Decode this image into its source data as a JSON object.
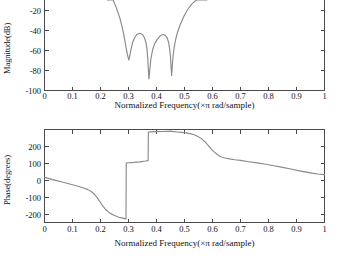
{
  "figure": {
    "background_color": "#ffffff",
    "line_color": "#8a8a8a",
    "axis_color": "#4a4a4a"
  },
  "panels": {
    "magnitude": {
      "ylabel": "Magnitude(dB)",
      "xlabel": "Normalized Frequency(×π rad/sample)",
      "ytick_labels": [
        "-20",
        "-40",
        "-60",
        "-80",
        "-100"
      ],
      "xtick_labels": [
        "0",
        "0.1",
        "0.2",
        "0.3",
        "0.4",
        "0.5",
        "0.6",
        "0.7",
        "0.8",
        "0.9",
        "1"
      ]
    },
    "phase": {
      "ylabel": "Phase(degrees)",
      "xlabel": "Normalized Frequency(×π rad/sample)",
      "ytick_labels": [
        "200",
        "100",
        "0",
        "-100",
        "-200"
      ],
      "xtick_labels": [
        "0",
        "0.1",
        "0.2",
        "0.3",
        "0.4",
        "0.5",
        "0.6",
        "0.7",
        "0.8",
        "0.9",
        "1"
      ]
    }
  },
  "chart_data": [
    {
      "type": "line",
      "title": "",
      "xlabel": "Normalized Frequency(×π rad/sample)",
      "ylabel": "Magnitude(dB)",
      "xlim": [
        0,
        1
      ],
      "ylim": [
        -100,
        -10
      ],
      "yticks": [
        -20,
        -40,
        -60,
        -80,
        -100
      ],
      "xticks": [
        0,
        0.1,
        0.2,
        0.3,
        0.4,
        0.5,
        0.6,
        0.7,
        0.8,
        0.9,
        1
      ],
      "grid": false,
      "legend": "none",
      "note": "Top panel is cropped at the top of the image; curve exits above the -10 dB visible edge for x<0.23 and x>0.58",
      "series": [
        {
          "name": "Magnitude response",
          "x": [
            0.225,
            0.235,
            0.245,
            0.255,
            0.262,
            0.27,
            0.277,
            0.283,
            0.288,
            0.292,
            0.296,
            0.299,
            0.301,
            0.303,
            0.306,
            0.31,
            0.315,
            0.322,
            0.33,
            0.34,
            0.35,
            0.357,
            0.362,
            0.366,
            0.369,
            0.371,
            0.373,
            0.376,
            0.38,
            0.386,
            0.394,
            0.404,
            0.414,
            0.424,
            0.432,
            0.438,
            0.443,
            0.447,
            0.45,
            0.452,
            0.454,
            0.456,
            0.459,
            0.463,
            0.468,
            0.475,
            0.485,
            0.497,
            0.51,
            0.525,
            0.542,
            0.56,
            0.58
          ],
          "y": [
            -10,
            -14,
            -19,
            -25,
            -30,
            -36,
            -43,
            -50,
            -57,
            -63,
            -68,
            -71,
            -73,
            -71,
            -67,
            -62,
            -57,
            -53,
            -50,
            -49,
            -50,
            -53,
            -57,
            -63,
            -72,
            -82,
            -90,
            -82,
            -72,
            -64,
            -58,
            -54,
            -51,
            -50,
            -51,
            -53,
            -57,
            -63,
            -70,
            -79,
            -87,
            -80,
            -70,
            -62,
            -55,
            -48,
            -41,
            -34,
            -28,
            -23,
            -18,
            -14,
            -10
          ]
        }
      ]
    },
    {
      "type": "line",
      "title": "",
      "xlabel": "Normalized Frequency(×π rad/sample)",
      "ylabel": "Phase(degrees)",
      "xlim": [
        0,
        1
      ],
      "ylim": [
        -280,
        280
      ],
      "yticks": [
        200,
        100,
        0,
        -100,
        -200
      ],
      "xticks": [
        0,
        0.1,
        0.2,
        0.3,
        0.4,
        0.5,
        0.6,
        0.7,
        0.8,
        0.9,
        1
      ],
      "grid": false,
      "legend": "none",
      "note": "Phase is wrapped; vertical jumps at x=0.292, x=0.371 and x=0.455",
      "series": [
        {
          "name": "Phase response",
          "x": [
            0.0,
            0.02,
            0.04,
            0.06,
            0.08,
            0.1,
            0.12,
            0.14,
            0.155,
            0.168,
            0.178,
            0.188,
            0.198,
            0.208,
            0.22,
            0.235,
            0.25,
            0.265,
            0.28,
            0.291,
            0.292,
            0.3,
            0.32,
            0.34,
            0.36,
            0.37,
            0.371,
            0.38,
            0.4,
            0.42,
            0.44,
            0.454,
            0.455,
            0.462,
            0.475,
            0.49,
            0.505,
            0.52,
            0.535,
            0.548,
            0.56,
            0.572,
            0.583,
            0.594,
            0.606,
            0.618,
            0.63,
            0.645,
            0.66,
            0.68,
            0.7,
            0.73,
            0.76,
            0.79,
            0.82,
            0.85,
            0.88,
            0.91,
            0.935,
            0.955,
            0.975,
            1.0
          ],
          "y": [
            -8,
            -17,
            -26,
            -35,
            -44,
            -53,
            -62,
            -72,
            -82,
            -95,
            -110,
            -130,
            -155,
            -180,
            -205,
            -225,
            -238,
            -248,
            -254,
            -258,
            78,
            80,
            82,
            85,
            90,
            93,
            265,
            266,
            267,
            268,
            269,
            270,
            268,
            267,
            265,
            263,
            260,
            255,
            248,
            238,
            225,
            208,
            188,
            165,
            145,
            128,
            116,
            108,
            103,
            98,
            94,
            86,
            79,
            71,
            62,
            52,
            42,
            31,
            23,
            17,
            12,
            8
          ]
        }
      ]
    }
  ]
}
